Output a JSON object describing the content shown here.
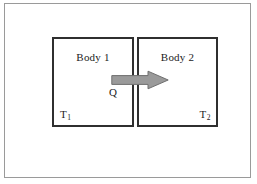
{
  "figure": {
    "frame": {
      "border_color": "#9a9a9a"
    }
  },
  "diagram": {
    "body_1": {
      "label": "Body 1",
      "temperature_label": "T",
      "temperature_subscript": "1"
    },
    "body_2": {
      "label": "Body 2",
      "temperature_label": "T",
      "temperature_subscript": "2"
    },
    "heat_flow": {
      "label": "Q",
      "direction": "left-to-right",
      "fill_color": "#9a9a9a",
      "stroke_color": "#6a6a6a"
    },
    "box_border_color": "#2f2f2f",
    "background_color": "#ffffff"
  }
}
